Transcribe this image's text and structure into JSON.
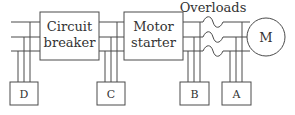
{
  "diagram": {
    "type": "motor-circuit-block-diagram",
    "colors": {
      "line": "#4a4a4a",
      "text": "#333333",
      "background": "#ffffff"
    },
    "blocks": {
      "circuit_breaker": {
        "line1": "Circuit",
        "line2": "breaker"
      },
      "motor_starter": {
        "line1": "Motor",
        "line2": "starter"
      },
      "motor": {
        "label": "M"
      }
    },
    "overloads_label": "Overloads",
    "taps": [
      {
        "label": "D"
      },
      {
        "label": "C"
      },
      {
        "label": "B"
      },
      {
        "label": "A"
      }
    ]
  }
}
